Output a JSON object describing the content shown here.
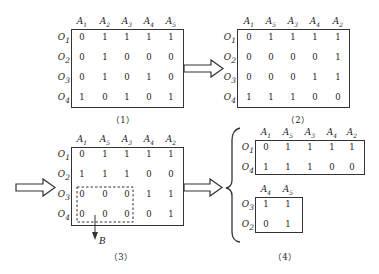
{
  "matrices": [
    {
      "caption": "（1）",
      "columns": [
        "A1",
        "A2",
        "A3",
        "A4",
        "A5"
      ],
      "rows": [
        {
          "label": "O1",
          "values": [
            "0",
            "1",
            "1",
            "1",
            "1"
          ]
        },
        {
          "label": "O2",
          "values": [
            "0",
            "1",
            "0",
            "0",
            "0"
          ]
        },
        {
          "label": "O3",
          "values": [
            "0",
            "1",
            "0",
            "1",
            "0"
          ]
        },
        {
          "label": "O4",
          "values": [
            "1",
            "0",
            "1",
            "0",
            "1"
          ]
        }
      ]
    },
    {
      "caption": "（2）",
      "columns": [
        "A1",
        "A5",
        "A3",
        "A4",
        "A2"
      ],
      "rows": [
        {
          "label": "O1",
          "values": [
            "0",
            "1",
            "1",
            "1",
            "1"
          ]
        },
        {
          "label": "O2",
          "values": [
            "0",
            "0",
            "0",
            "0",
            "1"
          ]
        },
        {
          "label": "O3",
          "values": [
            "0",
            "0",
            "0",
            "1",
            "1"
          ]
        },
        {
          "label": "O4",
          "values": [
            "1",
            "1",
            "1",
            "0",
            "0"
          ]
        }
      ]
    },
    {
      "caption": "（3）",
      "columns": [
        "A1",
        "A5",
        "A3",
        "A4",
        "A2"
      ],
      "rows": [
        {
          "label": "O1",
          "values": [
            "0",
            "1",
            "1",
            "1",
            "1"
          ]
        },
        {
          "label": "O2",
          "values": [
            "1",
            "1",
            "1",
            "0",
            "0"
          ]
        },
        {
          "label": "O3",
          "values": [
            "0",
            "0",
            "0",
            "1",
            "1"
          ]
        },
        {
          "label": "O4",
          "values": [
            "0",
            "0",
            "0",
            "0",
            "1"
          ]
        }
      ],
      "block_label": "B"
    },
    {
      "caption": "（4）",
      "sub_top": {
        "columns": [
          "A1",
          "A5",
          "A3",
          "A4",
          "A2"
        ],
        "rows": [
          {
            "label": "O1",
            "values": [
              "0",
              "1",
              "1",
              "1",
              "1"
            ]
          },
          {
            "label": "O4",
            "values": [
              "1",
              "1",
              "1",
              "0",
              "0"
            ]
          }
        ]
      },
      "sub_bottom": {
        "columns": [
          "A4",
          "A5"
        ],
        "rows": [
          {
            "label": "O3",
            "values": [
              "1",
              "1"
            ]
          },
          {
            "label": "O2",
            "values": [
              "0",
              "1"
            ]
          }
        ]
      }
    }
  ]
}
